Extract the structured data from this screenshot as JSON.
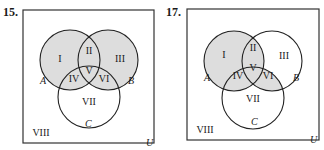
{
  "shade_color": "#d4d4d4",
  "diagrams": [
    {
      "number": "15.",
      "shaded_regions": [
        "I",
        "II",
        "III",
        "IV",
        "V",
        "VI"
      ],
      "set_labels": {
        "A": "A",
        "B": "B",
        "C": "C",
        "U": "U"
      },
      "regions": {
        "I": "I",
        "II": "II",
        "III": "III",
        "IV": "IV",
        "V": "V",
        "VI": "VI",
        "VII": "VII",
        "VIII": "VIII"
      }
    },
    {
      "number": "17.",
      "shaded_regions": [
        "I",
        "II",
        "IV",
        "V",
        "VI"
      ],
      "set_labels": {
        "A": "A",
        "B": "B",
        "C": "C",
        "U": "U"
      },
      "regions": {
        "I": "I",
        "II": "II",
        "III": "III",
        "IV": "IV",
        "V": "V",
        "VI": "VI",
        "VII": "VII",
        "VIII": "VIII"
      }
    }
  ]
}
